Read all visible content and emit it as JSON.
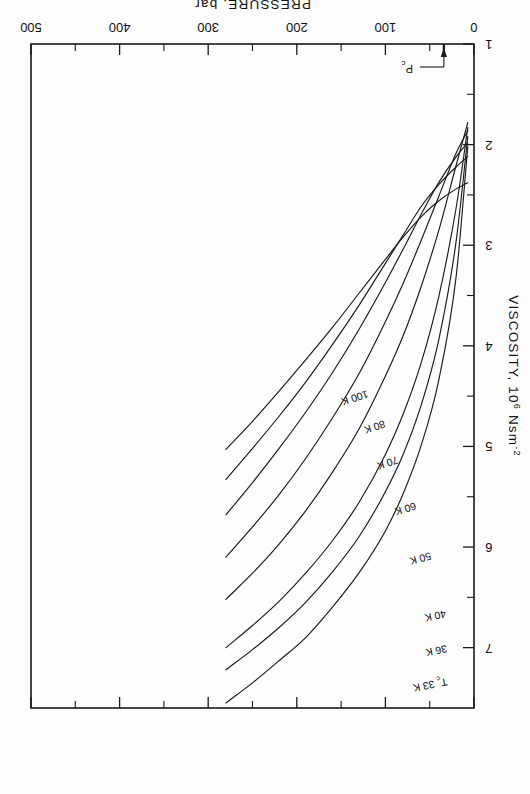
{
  "figure": {
    "orientation": "rotated-180",
    "background": "#fdfdfd",
    "ink": "#1a1a1a"
  },
  "chart_data": {
    "type": "line",
    "title": "",
    "xlabel": "PRESSURE, bar",
    "ylabel": "VISCOSITY, 10⁶ Nsm⁻²",
    "xlim": [
      0,
      500
    ],
    "ylim": [
      1,
      7.6
    ],
    "grid": false,
    "legend": "inline-curve-labels",
    "xticks": [
      0,
      100,
      200,
      300,
      400,
      500
    ],
    "xtick_labels": [
      "0",
      "100",
      "200",
      "300",
      "400",
      "500"
    ],
    "xminor_ticks": [
      50,
      150,
      250,
      350,
      450
    ],
    "yticks": [
      1,
      2,
      3,
      4,
      5,
      6,
      7
    ],
    "ytick_labels": [
      "1",
      "2",
      "3",
      "4",
      "5",
      "6",
      "7"
    ],
    "yminor_ticks": [
      1.5,
      2.5,
      3.5,
      4.5,
      5.5,
      6.5
    ],
    "annotations": [
      {
        "text": "Pc",
        "label_html": "P<sub>c</sub>",
        "x": 34,
        "y": 1.0,
        "kind": "arrow-marker",
        "note": "critical pressure marker on pressure axis"
      }
    ],
    "series": [
      {
        "name": "Tc 33 K",
        "label": "Tₑ 33 K",
        "temperature_K": 33,
        "x": [
          7,
          20,
          40,
          60,
          80,
          100,
          130,
          160,
          190,
          220,
          250,
          280
        ],
        "y": [
          2.02,
          3.3,
          4.35,
          5.0,
          5.47,
          5.84,
          6.26,
          6.6,
          6.9,
          7.13,
          7.35,
          7.55
        ]
      },
      {
        "name": "36 K",
        "label": "36 K",
        "temperature_K": 36,
        "x": [
          7,
          20,
          40,
          60,
          80,
          100,
          130,
          160,
          190,
          220,
          250,
          280
        ],
        "y": [
          1.92,
          2.95,
          3.95,
          4.6,
          5.08,
          5.45,
          5.9,
          6.25,
          6.55,
          6.8,
          7.02,
          7.22
        ]
      },
      {
        "name": "40 K",
        "label": "40 K",
        "temperature_K": 40,
        "x": [
          7,
          20,
          40,
          60,
          80,
          100,
          130,
          160,
          190,
          220,
          250,
          280
        ],
        "y": [
          1.83,
          2.62,
          3.52,
          4.18,
          4.68,
          5.08,
          5.56,
          5.94,
          6.26,
          6.54,
          6.78,
          7.0
        ]
      },
      {
        "name": "50 K",
        "label": "50 K",
        "temperature_K": 50,
        "x": [
          7,
          20,
          40,
          60,
          80,
          100,
          130,
          160,
          190,
          220,
          250,
          280
        ],
        "y": [
          1.78,
          2.2,
          2.86,
          3.42,
          3.9,
          4.3,
          4.83,
          5.26,
          5.64,
          5.97,
          6.26,
          6.52
        ]
      },
      {
        "name": "60 K",
        "label": "60 K",
        "temperature_K": 60,
        "x": [
          7,
          20,
          40,
          60,
          80,
          100,
          130,
          160,
          190,
          220,
          250,
          280
        ],
        "y": [
          1.86,
          2.08,
          2.52,
          2.96,
          3.38,
          3.76,
          4.28,
          4.72,
          5.12,
          5.48,
          5.8,
          6.1
        ]
      },
      {
        "name": "70 K",
        "label": "70 K",
        "temperature_K": 70,
        "x": [
          7,
          20,
          40,
          60,
          80,
          100,
          130,
          160,
          190,
          220,
          250,
          280
        ],
        "y": [
          1.98,
          2.12,
          2.38,
          2.7,
          3.04,
          3.37,
          3.84,
          4.27,
          4.66,
          5.02,
          5.36,
          5.68
        ]
      },
      {
        "name": "80 K",
        "label": "80 K",
        "temperature_K": 80,
        "x": [
          7,
          20,
          40,
          60,
          80,
          100,
          130,
          160,
          190,
          220,
          250,
          280
        ],
        "y": [
          2.12,
          2.22,
          2.4,
          2.62,
          2.9,
          3.18,
          3.6,
          3.99,
          4.36,
          4.7,
          5.02,
          5.33
        ]
      },
      {
        "name": "100 K",
        "label": "100 K",
        "temperature_K": 100,
        "x": [
          7,
          20,
          40,
          60,
          80,
          100,
          130,
          160,
          190,
          220,
          250,
          280
        ],
        "y": [
          2.38,
          2.44,
          2.56,
          2.72,
          2.92,
          3.14,
          3.48,
          3.82,
          4.14,
          4.45,
          4.75,
          5.03
        ]
      }
    ],
    "series_label_positions": [
      {
        "name": "Tc 33 K",
        "x": 30,
        "y": 7.33,
        "rot": -11
      },
      {
        "name": "36 K",
        "x": 30,
        "y": 7.01,
        "rot": -11
      },
      {
        "name": "40 K",
        "x": 32,
        "y": 6.67,
        "rot": -12
      },
      {
        "name": "50 K",
        "x": 48,
        "y": 6.09,
        "rot": -15
      },
      {
        "name": "60 K",
        "x": 66,
        "y": 5.59,
        "rot": -17
      },
      {
        "name": "70 K",
        "x": 86,
        "y": 5.13,
        "rot": -18
      },
      {
        "name": "80 K",
        "x": 100,
        "y": 4.78,
        "rot": -18
      },
      {
        "name": "100 K",
        "x": 120,
        "y": 4.48,
        "rot": -18
      }
    ]
  }
}
